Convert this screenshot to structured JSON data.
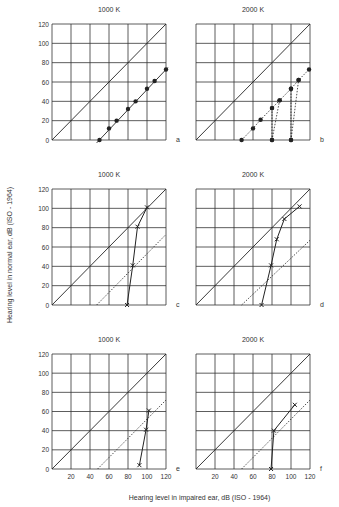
{
  "chart_data": {
    "type": "line",
    "figure": {
      "xlabel": "Hearing level in impaired ear, dB (ISO - 1964)",
      "ylabel": "Hearing level in normal ear, dB (ISO - 1964)",
      "xlim": [
        0,
        120
      ],
      "ylim": [
        0,
        120
      ],
      "x_ticks": [
        20,
        40,
        60,
        80,
        100,
        120
      ],
      "y_ticks": [
        0,
        20,
        40,
        60,
        80,
        100,
        120
      ],
      "grid": true,
      "x_tick_labels_shown_on": [
        "e",
        "f"
      ],
      "y_tick_labels_shown_on": [
        "a",
        "c",
        "e"
      ]
    },
    "panels": [
      {
        "id": "a",
        "title": "1000 K",
        "reference_line": {
          "style": "solid",
          "x": [
            0,
            120
          ],
          "y": [
            0,
            120
          ]
        },
        "series": [
          {
            "name": "measured",
            "marker": "filled-circle",
            "line": "solid",
            "x": [
              50,
              60,
              68,
              80,
              88,
              100,
              108,
              120
            ],
            "y": [
              0,
              12,
              20,
              32,
              40,
              53,
              61,
              73
            ]
          }
        ],
        "fit_line": {
          "style": "solid",
          "x": [
            47,
            122
          ],
          "y": [
            -3,
            75
          ]
        }
      },
      {
        "id": "b",
        "title": "2000 K",
        "reference_line": {
          "style": "solid",
          "x": [
            0,
            120
          ],
          "y": [
            0,
            120
          ]
        },
        "series": [
          {
            "name": "measured",
            "marker": "filled-circle",
            "line": "dotted",
            "x": [
              48,
              60,
              68,
              80,
              88,
              100,
              108,
              119
            ],
            "y": [
              0,
              12,
              21,
              33,
              41,
              53,
              62,
              73
            ]
          },
          {
            "name": "shift-from-80",
            "marker": "filled-circle",
            "line": "dotted",
            "x": [
              80,
              80,
              80,
              88
            ],
            "y": [
              0,
              33,
              0,
              41
            ],
            "segments": [
              [
                [
                  80,
                  0
                ],
                [
                  80,
                  33
                ]
              ],
              [
                [
                  80,
                  0
                ],
                [
                  88,
                  41
                ]
              ]
            ]
          },
          {
            "name": "shift-from-100",
            "marker": "filled-circle",
            "line": "dotted",
            "x": [
              100,
              100,
              100,
              108
            ],
            "y": [
              0,
              53,
              0,
              62
            ],
            "segments": [
              [
                [
                  100,
                  0
                ],
                [
                  100,
                  53
                ]
              ],
              [
                [
                  100,
                  0
                ],
                [
                  108,
                  62
                ]
              ]
            ]
          }
        ]
      },
      {
        "id": "c",
        "title": "1000 K",
        "reference_line": {
          "style": "solid",
          "x": [
            0,
            120
          ],
          "y": [
            0,
            120
          ]
        },
        "dotted_line": {
          "x": [
            47,
            120
          ],
          "y": [
            0,
            73
          ]
        },
        "series": [
          {
            "name": "measured",
            "marker": "cross",
            "line": "solid",
            "x": [
              79,
              85,
              90,
              100
            ],
            "y": [
              0,
              41,
              81,
              101
            ]
          }
        ]
      },
      {
        "id": "d",
        "title": "2000 K",
        "reference_line": {
          "style": "solid",
          "x": [
            0,
            120
          ],
          "y": [
            0,
            120
          ]
        },
        "dotted_line": {
          "x": [
            48,
            120
          ],
          "y": [
            0,
            67
          ]
        },
        "series": [
          {
            "name": "measured",
            "marker": "cross",
            "line": "solid",
            "x": [
              69,
              79,
              85,
              93,
              109
            ],
            "y": [
              0,
              41,
              68,
              89,
              102
            ]
          }
        ]
      },
      {
        "id": "e",
        "title": "1000 K",
        "reference_line": {
          "style": "solid",
          "x": [
            0,
            120
          ],
          "y": [
            0,
            120
          ]
        },
        "dotted_line": {
          "x": [
            48,
            120
          ],
          "y": [
            0,
            72
          ]
        },
        "series": [
          {
            "name": "measured",
            "marker": "cross",
            "line": "solid",
            "x": [
              92,
              99,
              102
            ],
            "y": [
              4,
              41,
              61
            ]
          }
        ]
      },
      {
        "id": "f",
        "title": "2000 K",
        "reference_line": {
          "style": "solid",
          "x": [
            0,
            120
          ],
          "y": [
            0,
            120
          ]
        },
        "dotted_line": {
          "x": [
            48,
            120
          ],
          "y": [
            0,
            72
          ]
        },
        "series": [
          {
            "name": "measured",
            "marker": "cross",
            "line": "solid",
            "x": [
              79,
              82,
              104
            ],
            "y": [
              0,
              40,
              67
            ]
          }
        ]
      }
    ]
  },
  "layout": {
    "panel_boxes": {
      "a": {
        "x": 52,
        "y": 24,
        "w": 114,
        "h": 116
      },
      "b": {
        "x": 196,
        "y": 24,
        "w": 114,
        "h": 116
      },
      "c": {
        "x": 52,
        "y": 189,
        "w": 114,
        "h": 116
      },
      "d": {
        "x": 196,
        "y": 189,
        "w": 114,
        "h": 116
      },
      "e": {
        "x": 52,
        "y": 354,
        "w": 114,
        "h": 115
      },
      "f": {
        "x": 196,
        "y": 354,
        "w": 114,
        "h": 115
      }
    }
  },
  "colors": {
    "ink": "#222222",
    "grid": "#333333",
    "text": "#333333"
  }
}
